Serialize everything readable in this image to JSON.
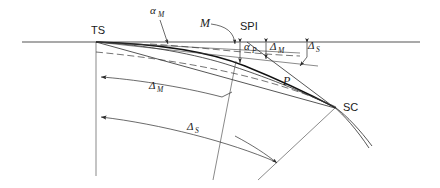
{
  "figure": {
    "type": "engineering-diagram",
    "background_color": "#ffffff",
    "line_color": "#2b2b2b"
  },
  "labels": {
    "ts": "TS",
    "sc": "SC",
    "spi": "SPI",
    "m_point": "M",
    "p_point": "P",
    "alpha": "α",
    "delta": "Δ",
    "sub_m": "M",
    "sub_p": "P",
    "sub_s": "S"
  },
  "annotations": [
    {
      "id": "ts",
      "text": "TS",
      "x": 91,
      "y": 34,
      "kind": "station-label"
    },
    {
      "id": "sc",
      "text": "SC",
      "x": 343,
      "y": 111,
      "kind": "station-label"
    },
    {
      "id": "spi",
      "text": "SPI",
      "x": 240,
      "y": 30,
      "kind": "station-label"
    },
    {
      "id": "m-point",
      "text": "M",
      "x": 203,
      "y": 25,
      "kind": "point-label"
    },
    {
      "id": "p-point",
      "text": "P",
      "x": 285,
      "y": 84,
      "kind": "point-label"
    },
    {
      "id": "alpha-m-top",
      "symbol": "α",
      "subscript": "M",
      "x": 153,
      "y": 14,
      "kind": "angle-label"
    },
    {
      "id": "alpha-p",
      "symbol": "α",
      "subscript": "P",
      "x": 247,
      "y": 49,
      "kind": "angle-label"
    },
    {
      "id": "delta-m-top",
      "symbol": "Δ",
      "subscript": "M",
      "x": 272,
      "y": 49,
      "kind": "offset-label"
    },
    {
      "id": "delta-s-top",
      "symbol": "Δ",
      "subscript": "S",
      "x": 307,
      "y": 48,
      "kind": "offset-label"
    },
    {
      "id": "delta-m-arc",
      "symbol": "Δ",
      "subscript": "M",
      "x": 152,
      "y": 88,
      "kind": "distance-label"
    },
    {
      "id": "delta-s-arc",
      "symbol": "Δ",
      "subscript": "S",
      "x": 190,
      "y": 130,
      "kind": "distance-label"
    }
  ],
  "geometry": {
    "tangent_line": {
      "x1": 22,
      "y1": 42,
      "x2": 420,
      "y2": 42
    },
    "ts_point": {
      "x": 96,
      "y": 42
    },
    "sc_point": {
      "x": 335,
      "y": 108
    },
    "vertical_from_ts": {
      "x": 96,
      "y1": 42,
      "y2": 176
    },
    "arrow_marks": [
      {
        "id": "delta-m-arrow",
        "x": 96,
        "y": 77
      },
      {
        "id": "delta-s-arrow",
        "x": 96,
        "y": 117
      }
    ]
  }
}
